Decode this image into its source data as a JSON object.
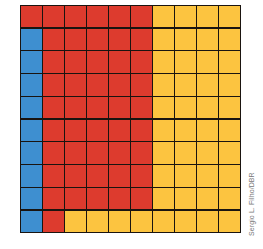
{
  "figure": {
    "type": "hundred-grid",
    "rows": 10,
    "columns": 10,
    "colors": {
      "blue": "#3e8fd0",
      "red": "#dd3b2e",
      "yellow": "#fcc440",
      "grid_line": "#1a1410"
    },
    "counts": {
      "blue": 9,
      "red": 47,
      "yellow": 44
    },
    "cells": [
      [
        "red",
        "red",
        "red",
        "red",
        "red",
        "red",
        "yellow",
        "yellow",
        "yellow",
        "yellow"
      ],
      [
        "blue",
        "red",
        "red",
        "red",
        "red",
        "red",
        "yellow",
        "yellow",
        "yellow",
        "yellow"
      ],
      [
        "blue",
        "red",
        "red",
        "red",
        "red",
        "red",
        "yellow",
        "yellow",
        "yellow",
        "yellow"
      ],
      [
        "blue",
        "red",
        "red",
        "red",
        "red",
        "red",
        "yellow",
        "yellow",
        "yellow",
        "yellow"
      ],
      [
        "blue",
        "red",
        "red",
        "red",
        "red",
        "red",
        "yellow",
        "yellow",
        "yellow",
        "yellow"
      ],
      [
        "blue",
        "red",
        "red",
        "red",
        "red",
        "red",
        "yellow",
        "yellow",
        "yellow",
        "yellow"
      ],
      [
        "blue",
        "red",
        "red",
        "red",
        "red",
        "red",
        "yellow",
        "yellow",
        "yellow",
        "yellow"
      ],
      [
        "blue",
        "red",
        "red",
        "red",
        "red",
        "red",
        "yellow",
        "yellow",
        "yellow",
        "yellow"
      ],
      [
        "blue",
        "red",
        "red",
        "red",
        "red",
        "red",
        "yellow",
        "yellow",
        "yellow",
        "yellow"
      ],
      [
        "blue",
        "red",
        "yellow",
        "yellow",
        "yellow",
        "yellow",
        "yellow",
        "yellow",
        "yellow",
        "yellow"
      ]
    ]
  },
  "credit": "Sergio L. Filho/DBR"
}
